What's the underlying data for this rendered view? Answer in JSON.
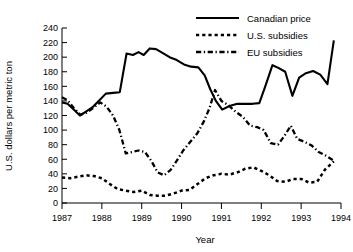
{
  "chart_data": {
    "type": "line",
    "title": "",
    "xlabel": "Year",
    "ylabel": "U.S. dollars per metric ton",
    "xlim": [
      1987,
      1994
    ],
    "ylim": [
      0,
      240
    ],
    "ytick_step": 20,
    "yticks": [
      0,
      20,
      40,
      60,
      80,
      100,
      120,
      140,
      160,
      180,
      200,
      220,
      240
    ],
    "xticks": [
      1987,
      1988,
      1989,
      1990,
      1991,
      1992,
      1993,
      1994
    ],
    "xtick_labels": [
      "1987",
      "1988",
      "1989",
      "1990",
      "1991",
      "1992",
      "1993",
      "1994"
    ],
    "ytick_labels": [
      "0",
      "20",
      "40",
      "60",
      "80",
      "100",
      "120",
      "140",
      "160",
      "180",
      "200",
      "220",
      "240"
    ],
    "grid": false,
    "legend_position": "top-right",
    "series": [
      {
        "name": "Canadian price",
        "style": "solid",
        "color": "#000000",
        "x": [
          1987.0,
          1987.14,
          1987.3,
          1987.45,
          1987.62,
          1987.76,
          1987.92,
          1988.1,
          1988.28,
          1988.45,
          1988.62,
          1988.78,
          1988.92,
          1989.05,
          1989.2,
          1989.36,
          1989.52,
          1989.7,
          1989.88,
          1990.06,
          1990.24,
          1990.42,
          1990.58,
          1990.72,
          1990.86,
          1991.02,
          1991.2,
          1991.4,
          1991.6,
          1991.78,
          1991.95,
          1992.1,
          1992.28,
          1992.44,
          1992.6,
          1992.78,
          1992.95,
          1993.12,
          1993.3,
          1993.48,
          1993.66,
          1993.82
        ],
        "y": [
          138,
          136,
          128,
          120,
          126,
          131,
          140,
          150,
          151,
          152,
          205,
          203,
          207,
          203,
          212,
          211,
          206,
          200,
          196,
          190,
          187,
          186,
          175,
          156,
          140,
          128,
          133,
          136,
          136,
          136,
          137,
          160,
          189,
          185,
          180,
          147,
          172,
          178,
          181,
          176,
          163,
          223
        ]
      },
      {
        "name": "U.S. subsidies",
        "style": "dotted",
        "color": "#000000",
        "x": [
          1987.0,
          1987.2,
          1987.4,
          1987.6,
          1987.8,
          1988.0,
          1988.2,
          1988.4,
          1988.6,
          1988.8,
          1989.0,
          1989.2,
          1989.4,
          1989.6,
          1989.8,
          1990.0,
          1990.2,
          1990.4,
          1990.6,
          1990.8,
          1991.0,
          1991.2,
          1991.4,
          1991.6,
          1991.8,
          1992.0,
          1992.2,
          1992.4,
          1992.6,
          1992.8,
          1993.0,
          1993.2,
          1993.4,
          1993.6,
          1993.82
        ],
        "y": [
          35,
          34,
          36,
          38,
          37,
          34,
          26,
          19,
          17,
          15,
          17,
          11,
          10,
          10,
          13,
          17,
          18,
          26,
          34,
          38,
          40,
          39,
          42,
          47,
          49,
          44,
          38,
          30,
          29,
          33,
          33,
          28,
          29,
          46,
          57
        ]
      },
      {
        "name": "EU subsidies",
        "style": "dash-dot",
        "color": "#000000",
        "x": [
          1987.0,
          1987.14,
          1987.3,
          1987.46,
          1987.62,
          1987.8,
          1987.96,
          1988.12,
          1988.28,
          1988.44,
          1988.6,
          1988.76,
          1988.92,
          1989.08,
          1989.24,
          1989.4,
          1989.56,
          1989.72,
          1989.88,
          1990.04,
          1990.22,
          1990.4,
          1990.56,
          1990.7,
          1990.84,
          1991.0,
          1991.18,
          1991.36,
          1991.54,
          1991.72,
          1991.9,
          1992.06,
          1992.24,
          1992.42,
          1992.58,
          1992.74,
          1992.9,
          1993.08,
          1993.26,
          1993.44,
          1993.62,
          1993.82
        ],
        "y": [
          145,
          141,
          130,
          121,
          124,
          131,
          138,
          132,
          120,
          100,
          68,
          70,
          72,
          70,
          58,
          42,
          38,
          45,
          58,
          72,
          84,
          96,
          112,
          130,
          155,
          140,
          134,
          125,
          118,
          106,
          104,
          100,
          82,
          80,
          92,
          106,
          88,
          84,
          79,
          70,
          65,
          58
        ]
      }
    ]
  },
  "legend": {
    "items": [
      {
        "label": "Canadian price",
        "style": "solid"
      },
      {
        "label": "U.S. subsidies",
        "style": "dotted"
      },
      {
        "label": "EU subsidies",
        "style": "dash-dot"
      }
    ]
  }
}
